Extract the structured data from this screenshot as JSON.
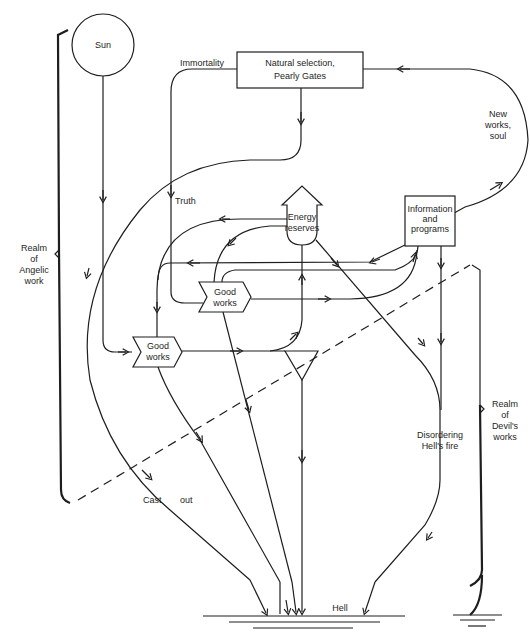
{
  "diagram": {
    "type": "energy-flow diagram",
    "nodes": {
      "sun": {
        "label": "Sun"
      },
      "natural_selection": {
        "line1": "Natural  selection,",
        "line2": "Pearly Gates"
      },
      "energy_reserves": {
        "line1": "Energy",
        "line2": "reserves"
      },
      "information_programs": {
        "line1": "Information",
        "line2": "and",
        "line3": "programs"
      },
      "good_works_upper": {
        "line1": "Good",
        "line2": "works"
      },
      "good_works_lower": {
        "line1": "Good",
        "line2": "works"
      },
      "hell": {
        "label": "Hell"
      }
    },
    "flow_labels": {
      "immortality": "Immortality",
      "truth": "Truth",
      "new_works_soul": {
        "line1": "New",
        "line2": "works,",
        "line3": "soul"
      },
      "cast_out": {
        "word1": "Cast",
        "word2": "out"
      },
      "disordering": {
        "line1": "Disordering",
        "line2": "Hell's fire"
      }
    },
    "realms": {
      "angelic": {
        "line1": "Realm",
        "line2": "of",
        "line3": "Angelic",
        "line4": "work"
      },
      "devil": {
        "line1": "Realm",
        "line2": "of",
        "line3": "Devil's",
        "line4": "works"
      }
    }
  }
}
